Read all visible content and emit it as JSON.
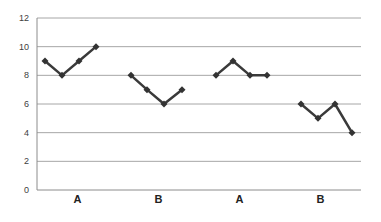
{
  "chart_data": {
    "type": "line",
    "title": "",
    "xlabel": "",
    "ylabel": "",
    "ylim": [
      0,
      12
    ],
    "yticks": [
      0,
      2,
      4,
      6,
      8,
      10,
      12
    ],
    "grid": true,
    "legend": null,
    "categories": [
      "A",
      "B",
      "A",
      "B"
    ],
    "series": [
      {
        "name": "A",
        "group": 0,
        "values": [
          9,
          8,
          9,
          10
        ]
      },
      {
        "name": "B",
        "group": 1,
        "values": [
          8,
          7,
          6,
          7
        ]
      },
      {
        "name": "A",
        "group": 2,
        "values": [
          8,
          9,
          8,
          8
        ]
      },
      {
        "name": "B",
        "group": 3,
        "values": [
          6,
          5,
          6,
          4
        ]
      }
    ],
    "colors": {
      "line": "#3a3a3a",
      "marker": "#333333",
      "grid": "#a6a6a6",
      "axis": "#8c8c8c",
      "tick_text": "#404040"
    }
  }
}
